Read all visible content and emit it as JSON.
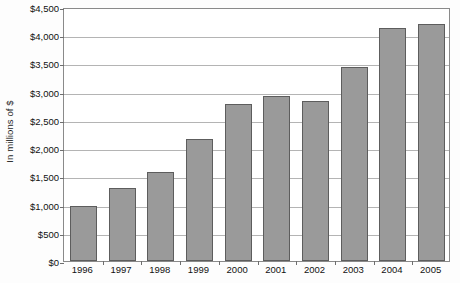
{
  "chart_data": {
    "type": "bar",
    "title": "",
    "subtitle": "",
    "xlabel": "",
    "ylabel": "In millions of $",
    "categories": [
      "1996",
      "1997",
      "1998",
      "1999",
      "2000",
      "2001",
      "2002",
      "2003",
      "2004",
      "2005"
    ],
    "values": [
      970,
      1300,
      1570,
      2160,
      2780,
      2930,
      2840,
      3440,
      4120,
      4200
    ],
    "series": [
      {
        "name": "",
        "values": [
          970,
          1300,
          1570,
          2160,
          2780,
          2930,
          2840,
          3440,
          4120,
          4200
        ]
      }
    ],
    "ylim": [
      0,
      4500
    ],
    "ytick_values": [
      0,
      500,
      1000,
      1500,
      2000,
      2500,
      3000,
      3500,
      4000,
      4500
    ],
    "ytick_labels": [
      "$0",
      "$500",
      "$1,000",
      "$1,500",
      "$2,000",
      "$2,500",
      "$3,000",
      "$3,500",
      "$4,000",
      "$4,500"
    ],
    "grid": true,
    "grid_axis": "y",
    "legend": false,
    "legend_position": "none",
    "bar_color": "#9a9a9a",
    "bar_border_color": "#5d5d5d",
    "gridline_color": "#b4b4b4",
    "axis_color": "#8a8a8a",
    "background_color": "#ffffff",
    "text_color": "#111111"
  }
}
